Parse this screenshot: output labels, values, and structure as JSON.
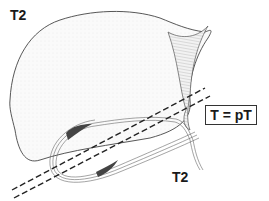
{
  "diagram": {
    "labels": {
      "top_left": "T2",
      "bottom": "T2",
      "box": "T = pT"
    },
    "elements": [
      {
        "name": "organ-outline",
        "description": "large rounded organ (liver) outline"
      },
      {
        "name": "wall-structure",
        "description": "concave hatched wedge structure on right side"
      },
      {
        "name": "layered-loop",
        "description": "elongated multilayered wall loop (gallbladder) with dark tumor patches"
      },
      {
        "name": "cut-lines",
        "description": "two parallel dashed lines crossing diagonally"
      }
    ],
    "colors": {
      "line": "#333333",
      "tumor": "#444444",
      "fill": "#f4f4f4"
    }
  }
}
